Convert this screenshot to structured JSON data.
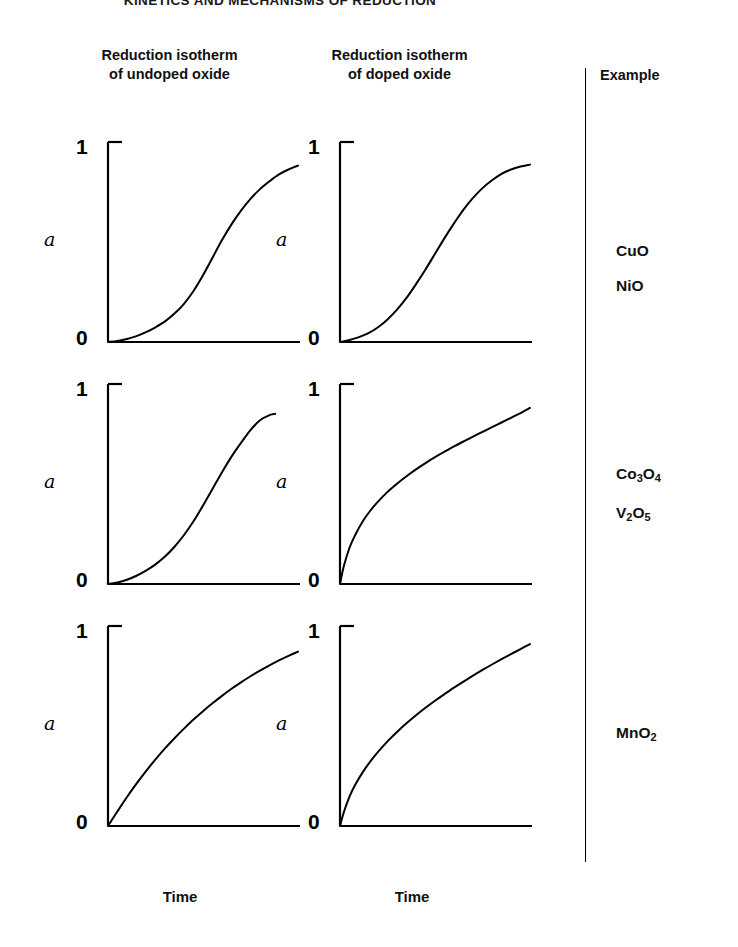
{
  "running_head": "KINETICS AND MECHANISMS OF REDUCTION",
  "headers": {
    "undoped_line1": "Reduction isotherm",
    "undoped_line2": "of undoped oxide",
    "doped_line1": "Reduction isotherm",
    "doped_line2": "of doped oxide",
    "example": "Example"
  },
  "axes": {
    "y_max_label": "1",
    "y_min_label": "0",
    "y_symbol": "a",
    "x_title_left": "Time",
    "x_title_right": "Time"
  },
  "examples": {
    "row1": [
      {
        "formula": "CuO",
        "html": "CuO"
      },
      {
        "formula": "NiO",
        "html": "NiO"
      }
    ],
    "row2": [
      {
        "formula": "Co3O4",
        "html": "Co<sub>3</sub>O<sub>4</sub>"
      },
      {
        "formula": "V2O5",
        "html": "V<sub>2</sub>O<sub>5</sub>"
      }
    ],
    "row3": [
      {
        "formula": "MnO2",
        "html": "MnO<sub>2</sub>"
      }
    ]
  },
  "colors": {
    "ink": "#000000",
    "background": "#ffffff",
    "curve": "#000000"
  },
  "chart_data": {
    "type": "line",
    "xlabel": "Time",
    "ylabel": "a",
    "xlim": [
      0,
      1
    ],
    "ylim": [
      0,
      1
    ],
    "ytick_labels": [
      "0",
      "1"
    ],
    "grid": false,
    "legend": false,
    "panel_grid": {
      "rows": 3,
      "cols": 2
    },
    "panels": [
      {
        "row": 1,
        "col": 1,
        "column_label": "Reduction isotherm of undoped oxide",
        "examples": [
          "CuO",
          "NiO"
        ],
        "shape": "sigmoid-long-induction",
        "description": "Sigmoid curve with pronounced induction period, acceleratory then deceleratory",
        "x": [
          0.0,
          0.05,
          0.1,
          0.15,
          0.2,
          0.25,
          0.3,
          0.35,
          0.4,
          0.45,
          0.5,
          0.55,
          0.6,
          0.65,
          0.7,
          0.75,
          0.8,
          0.85,
          0.9,
          0.95,
          1.0
        ],
        "y": [
          0.0,
          0.005,
          0.015,
          0.03,
          0.05,
          0.075,
          0.105,
          0.145,
          0.195,
          0.26,
          0.34,
          0.43,
          0.52,
          0.6,
          0.67,
          0.73,
          0.78,
          0.82,
          0.855,
          0.88,
          0.9
        ]
      },
      {
        "row": 1,
        "col": 2,
        "column_label": "Reduction isotherm of doped oxide",
        "examples": [
          "CuO",
          "NiO"
        ],
        "shape": "sigmoid-short-induction",
        "description": "Sigmoid curve with shorter induction period, reaches plateau sooner",
        "x": [
          0.0,
          0.05,
          0.1,
          0.15,
          0.2,
          0.25,
          0.3,
          0.35,
          0.4,
          0.45,
          0.5,
          0.55,
          0.6,
          0.65,
          0.7,
          0.75,
          0.8,
          0.85,
          0.9,
          0.95,
          1.0
        ],
        "y": [
          0.0,
          0.01,
          0.025,
          0.045,
          0.075,
          0.115,
          0.165,
          0.225,
          0.295,
          0.37,
          0.45,
          0.53,
          0.605,
          0.675,
          0.735,
          0.785,
          0.825,
          0.858,
          0.88,
          0.895,
          0.905
        ]
      },
      {
        "row": 2,
        "col": 1,
        "column_label": "Reduction isotherm of undoped oxide",
        "examples": [
          "Co3O4",
          "V2O5"
        ],
        "shape": "sigmoid-truncated",
        "description": "Sigmoid curve with induction period, terminating before the right edge of the axis",
        "x": [
          0.0,
          0.05,
          0.1,
          0.15,
          0.2,
          0.25,
          0.3,
          0.35,
          0.4,
          0.45,
          0.5,
          0.55,
          0.6,
          0.65,
          0.7,
          0.75,
          0.8,
          0.85,
          0.88
        ],
        "y": [
          0.0,
          0.008,
          0.022,
          0.042,
          0.068,
          0.1,
          0.14,
          0.19,
          0.25,
          0.32,
          0.4,
          0.485,
          0.57,
          0.65,
          0.72,
          0.785,
          0.835,
          0.862,
          0.868
        ]
      },
      {
        "row": 2,
        "col": 2,
        "column_label": "Reduction isotherm of doped oxide",
        "examples": [
          "Co3O4",
          "V2O5"
        ],
        "shape": "deceleratory-steep",
        "description": "Purely deceleratory curve rising very steeply from origin then flattening",
        "x": [
          0.0,
          0.02,
          0.05,
          0.08,
          0.12,
          0.16,
          0.2,
          0.25,
          0.3,
          0.35,
          0.4,
          0.45,
          0.5,
          0.55,
          0.6,
          0.65,
          0.7,
          0.75,
          0.8,
          0.85,
          0.9,
          0.95,
          1.0
        ],
        "y": [
          0.0,
          0.09,
          0.185,
          0.25,
          0.32,
          0.375,
          0.42,
          0.47,
          0.512,
          0.55,
          0.585,
          0.617,
          0.647,
          0.675,
          0.702,
          0.727,
          0.752,
          0.776,
          0.8,
          0.824,
          0.848,
          0.872,
          0.898
        ]
      },
      {
        "row": 3,
        "col": 1,
        "column_label": "Reduction isotherm of undoped oxide",
        "examples": [
          "MnO2"
        ],
        "shape": "deceleratory-linear-start",
        "description": "Deceleratory curve with near-linear initial slope, gradually flattening",
        "x": [
          0.0,
          0.05,
          0.1,
          0.15,
          0.2,
          0.25,
          0.3,
          0.35,
          0.4,
          0.45,
          0.5,
          0.55,
          0.6,
          0.65,
          0.7,
          0.75,
          0.8,
          0.85,
          0.9,
          0.95,
          1.0
        ],
        "y": [
          0.0,
          0.075,
          0.148,
          0.216,
          0.28,
          0.34,
          0.396,
          0.448,
          0.497,
          0.543,
          0.586,
          0.626,
          0.664,
          0.7,
          0.733,
          0.764,
          0.793,
          0.82,
          0.845,
          0.868,
          0.89
        ]
      },
      {
        "row": 3,
        "col": 2,
        "column_label": "Reduction isotherm of doped oxide",
        "examples": [
          "MnO2"
        ],
        "shape": "deceleratory-steep",
        "description": "Deceleratory curve rising steeply from origin, reaching higher final conversion",
        "x": [
          0.0,
          0.02,
          0.05,
          0.08,
          0.12,
          0.16,
          0.2,
          0.25,
          0.3,
          0.35,
          0.4,
          0.45,
          0.5,
          0.55,
          0.6,
          0.65,
          0.7,
          0.75,
          0.8,
          0.85,
          0.9,
          0.95,
          1.0
        ],
        "y": [
          0.0,
          0.07,
          0.15,
          0.21,
          0.275,
          0.33,
          0.378,
          0.432,
          0.48,
          0.524,
          0.565,
          0.603,
          0.639,
          0.673,
          0.706,
          0.737,
          0.767,
          0.796,
          0.824,
          0.851,
          0.877,
          0.903,
          0.928
        ]
      }
    ]
  }
}
